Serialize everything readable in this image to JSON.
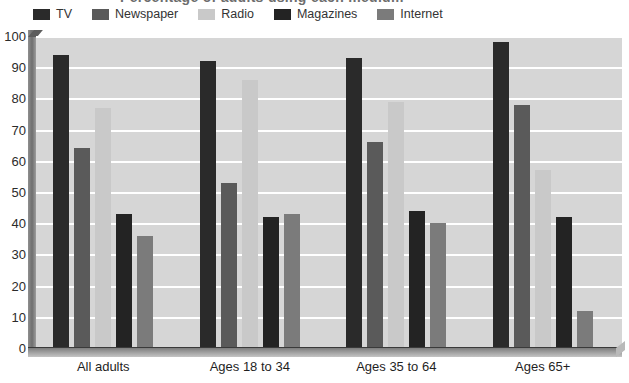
{
  "title_sliver": "Percentage of adults using each medium",
  "legend": {
    "position": "top-left",
    "items": [
      {
        "label": "TV",
        "color": "#2a2a2a",
        "icon": "legend-swatch-icon"
      },
      {
        "label": "Newspaper",
        "color": "#5a5a5a",
        "icon": "legend-swatch-icon"
      },
      {
        "label": "Radio",
        "color": "#c9c9c9",
        "icon": "legend-swatch-icon"
      },
      {
        "label": "Magazines",
        "color": "#232323",
        "icon": "legend-swatch-icon"
      },
      {
        "label": "Internet",
        "color": "#7b7b7b",
        "icon": "legend-swatch-icon"
      }
    ]
  },
  "axes": {
    "y_ticks": [
      0,
      10,
      20,
      30,
      40,
      50,
      60,
      70,
      80,
      90,
      100
    ],
    "y_min": 0,
    "y_max": 100,
    "grid": true,
    "plot_background": "#d6d6d6",
    "gridline_color": "#ffffff"
  },
  "chart_data": {
    "type": "bar",
    "title": "",
    "xlabel": "",
    "ylabel": "",
    "ylim": [
      0,
      100
    ],
    "grid": true,
    "legend_position": "top-left",
    "categories": [
      "All adults",
      "Ages 18 to 34",
      "Ages 35 to 64",
      "Ages 65+"
    ],
    "series": [
      {
        "name": "TV",
        "color": "#2a2a2a",
        "values": [
          94,
          92,
          93,
          98
        ]
      },
      {
        "name": "Newspaper",
        "color": "#5a5a5a",
        "values": [
          64,
          53,
          66,
          78
        ]
      },
      {
        "name": "Radio",
        "color": "#c9c9c9",
        "values": [
          77,
          86,
          79,
          57
        ]
      },
      {
        "name": "Magazines",
        "color": "#232323",
        "values": [
          43,
          42,
          44,
          42
        ]
      },
      {
        "name": "Internet",
        "color": "#7b7b7b",
        "values": [
          36,
          43,
          40,
          12
        ]
      }
    ]
  }
}
